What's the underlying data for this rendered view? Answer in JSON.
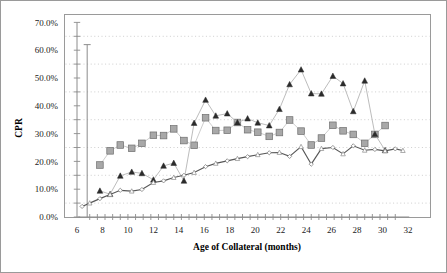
{
  "chart_data": {
    "type": "line",
    "title": "",
    "xlabel": "Age of Collateral (months)",
    "ylabel": "CPR",
    "xlim": [
      6,
      32
    ],
    "ylim": [
      0,
      70
    ],
    "xticks": [
      6,
      8,
      10,
      12,
      14,
      16,
      18,
      20,
      22,
      24,
      26,
      28,
      30,
      32
    ],
    "xtick_labels": [
      "6",
      "8",
      "10",
      "12",
      "14",
      "16",
      "18",
      "20",
      "22",
      "24",
      "26",
      "28",
      "30",
      "32"
    ],
    "yticks": [
      0,
      10,
      20,
      30,
      40,
      50,
      60,
      70
    ],
    "ytick_labels": [
      "0.0%",
      "10.0%",
      "20.0%",
      "30.0%",
      "40.0%",
      "50.0%",
      "60.0%",
      "70.0%"
    ],
    "grid": "horizontal-dotted-minor",
    "gridline_values": [
      5,
      15,
      25,
      35,
      45,
      55,
      65
    ],
    "legend": "none",
    "series": [
      {
        "name": "series-squares",
        "marker": "square",
        "color": "#a8a8a8",
        "x": [
          7.8,
          8.6,
          9.4,
          10.3,
          11.1,
          12.0,
          12.8,
          13.6,
          14.4,
          15.2,
          16.1,
          16.9,
          17.8,
          18.6,
          19.4,
          20.2,
          21.1,
          21.9,
          22.7,
          23.6,
          24.4,
          25.2,
          26.1,
          26.9,
          27.7,
          28.6,
          29.4,
          30.2
        ],
        "values": [
          18.7,
          23.8,
          25.9,
          24.7,
          26.5,
          29.4,
          29.3,
          31.7,
          27.5,
          25.8,
          35.7,
          31.1,
          31.2,
          34.0,
          31.4,
          30.5,
          29.0,
          30.4,
          34.9,
          30.9,
          25.9,
          28.4,
          33.0,
          31.0,
          29.7,
          26.5,
          29.7,
          32.9
        ]
      },
      {
        "name": "series-filled-triangles",
        "marker": "triangle-filled",
        "color": "#2b2b2b",
        "x": [
          7.8,
          8.6,
          9.4,
          10.3,
          11.1,
          12.0,
          12.8,
          13.6,
          14.4,
          15.2,
          16.1,
          16.9,
          17.8,
          18.6,
          19.4,
          20.2,
          21.1,
          21.9,
          22.7,
          23.6,
          24.4,
          25.2,
          26.1,
          26.9,
          27.7,
          28.6,
          29.4,
          30.2
        ],
        "values": [
          9.4,
          8.2,
          14.8,
          16.2,
          15.7,
          13.4,
          18.4,
          19.4,
          13.0,
          33.8,
          42.1,
          36.4,
          37.2,
          34.0,
          35.4,
          33.9,
          32.9,
          38.8,
          47.7,
          53.0,
          44.4,
          44.3,
          50.7,
          48.0,
          38.0,
          49.0,
          29.8,
          24.0
        ]
      },
      {
        "name": "series-open-triangles-line",
        "marker": "triangle-open",
        "color": "#575757",
        "x": [
          6.4,
          7.0,
          7.8,
          8.6,
          9.4,
          10.3,
          11.1,
          12.0,
          12.8,
          13.6,
          14.4,
          15.2,
          16.1,
          16.9,
          17.8,
          18.6,
          19.4,
          20.2,
          21.1,
          21.9,
          22.7,
          23.6,
          24.4,
          25.2,
          26.1,
          26.9,
          27.7,
          28.6,
          29.4,
          30.2,
          31.0,
          31.6
        ],
        "values": [
          3.8,
          5.0,
          6.6,
          8.1,
          9.6,
          9.3,
          9.9,
          12.4,
          13.0,
          14.2,
          15.0,
          16.0,
          18.1,
          19.3,
          20.2,
          21.0,
          21.7,
          22.4,
          23.1,
          23.2,
          21.8,
          25.3,
          19.0,
          24.6,
          25.0,
          22.7,
          25.6,
          24.0,
          24.3,
          23.8,
          24.5,
          23.9
        ]
      }
    ],
    "error_bar": {
      "name": "vertical-range-line",
      "x": 6.8,
      "low": 0.0,
      "high": 62.0
    }
  }
}
